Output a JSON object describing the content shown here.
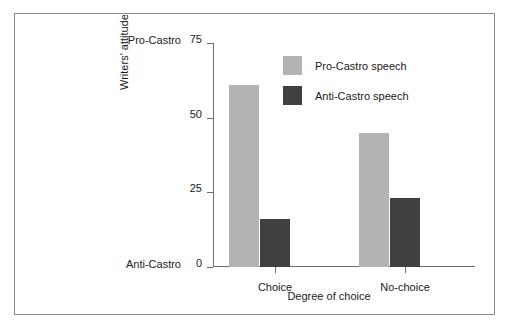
{
  "chart_data": {
    "type": "bar",
    "title": "",
    "categories": [
      "Choice",
      "No-choice"
    ],
    "series": [
      {
        "name": "Pro-Castro speech",
        "values": [
          61,
          45
        ],
        "color": "#b3b3b3"
      },
      {
        "name": "Anti-Castro speech",
        "values": [
          16,
          23
        ],
        "color": "#404040"
      }
    ],
    "xlabel": "Degree of choice",
    "ylabel": "Writers' attitude",
    "ylim": [
      0,
      75
    ],
    "yticks": [
      0,
      25,
      50,
      75
    ],
    "ytick_labels": [
      "0",
      "25",
      "50",
      "75"
    ],
    "y_anchor_labels": [
      {
        "value": 75,
        "text": "Pro-Castro"
      },
      {
        "value": 0,
        "text": "Anti-Castro"
      }
    ],
    "grid": false,
    "legend_position": "top-right",
    "frame_color": "#8c8c8c",
    "axis_color": "#6e6e6e",
    "background": "#ffffff"
  }
}
